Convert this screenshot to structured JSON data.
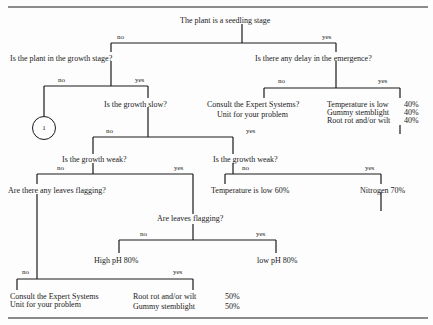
{
  "diagram": {
    "type": "decision-tree",
    "root": {
      "question": "The plant is a seedling stage",
      "no_label": "no",
      "yes_label": "yes"
    },
    "growth_stage": {
      "question": "Is the plant in the growth stage?",
      "no_label": "no",
      "yes_label": "yes",
      "no_connector": "1"
    },
    "emergence_delay": {
      "question": "Is there any delay in the emergence?",
      "no_label": "no",
      "yes_label": "yes",
      "no_result_line1": "Consult the Expert Systems?",
      "no_result_line2": "Unit for your problem",
      "yes_results": [
        {
          "cause": "Temperature is low",
          "pct": "40%"
        },
        {
          "cause": "Gummy stemblight",
          "pct": "40%"
        },
        {
          "cause": "Root rot and/or wilt",
          "pct": "40%"
        }
      ]
    },
    "growth_slow": {
      "question": "Is the growth slow?",
      "no_label": "no",
      "yes_label": "yes"
    },
    "growth_weak_left": {
      "question": "Is the growth weak?",
      "no_label": "no",
      "yes_label": "yes"
    },
    "growth_weak_right": {
      "question": "Is the growth weak?",
      "no_label": "no",
      "yes_label": "yes",
      "no_result": "Temperature is low 60%",
      "yes_result": "Nitrogen 70%"
    },
    "leaves_flagging_any": {
      "question": "Are there any leaves flagging?",
      "no_label": "no",
      "yes_label": "yes",
      "no_result_line1": "Consult the Expert Systems",
      "no_result_line2": "Unit for your problem",
      "yes_results": [
        {
          "cause": "Root rot and/or wilt",
          "pct": "50%"
        },
        {
          "cause": "Gummy stemblight",
          "pct": "50%"
        }
      ]
    },
    "leaves_flagging": {
      "question": "Are leaves flagging?",
      "no_label": "no",
      "yes_label": "yes",
      "no_result": "High pH 80%",
      "yes_result": "low pH 80%"
    }
  }
}
